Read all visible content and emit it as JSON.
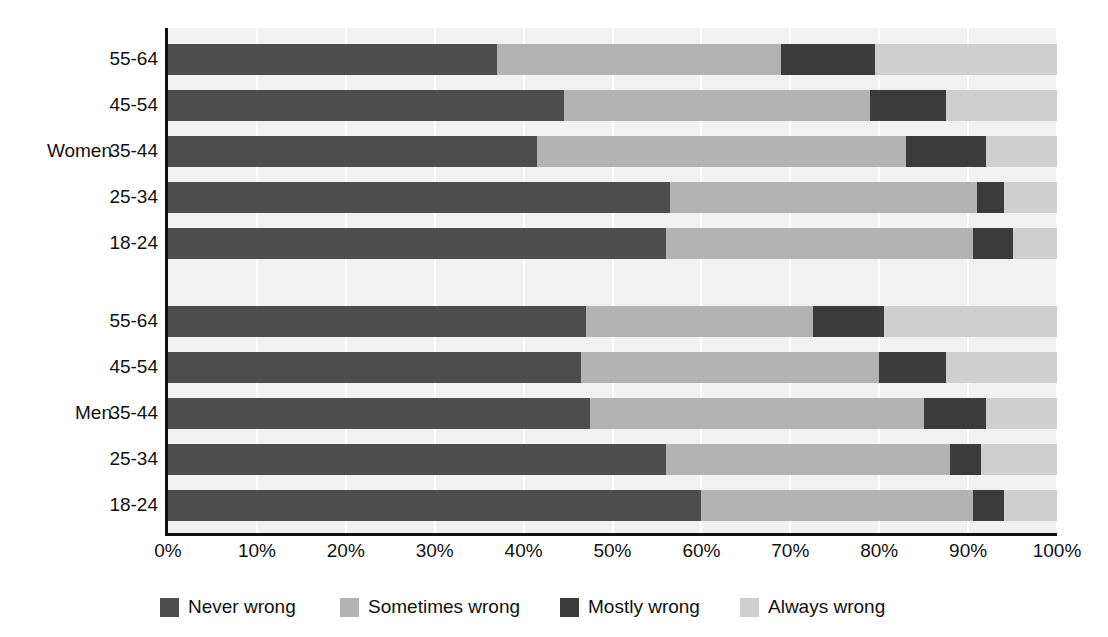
{
  "chart_data": {
    "type": "bar",
    "subtype": "stacked-horizontal-100",
    "title": "",
    "xlabel": "",
    "ylabel": "",
    "xlim": [
      0,
      100
    ],
    "xticks": [
      "0%",
      "10%",
      "20%",
      "30%",
      "40%",
      "50%",
      "60%",
      "70%",
      "80%",
      "90%",
      "100%"
    ],
    "xtick_values": [
      0,
      10,
      20,
      30,
      40,
      50,
      60,
      70,
      80,
      90,
      100
    ],
    "grid": true,
    "legend_position": "bottom",
    "groups": [
      "Women",
      "Men"
    ],
    "categories": [
      "55-64",
      "45-54",
      "35-44",
      "25-34",
      "18-24"
    ],
    "series": [
      {
        "name": "Never wrong",
        "color": "#4d4d4d"
      },
      {
        "name": "Sometimes wrong",
        "color": "#b3b3b3"
      },
      {
        "name": "Mostly wrong",
        "color": "#3b3b3b"
      },
      {
        "name": "Always wrong",
        "color": "#cfcfcf"
      }
    ],
    "rows": [
      {
        "group": "Women",
        "category": "55-64",
        "values": [
          37.0,
          32.0,
          10.5,
          20.5
        ]
      },
      {
        "group": "Women",
        "category": "45-54",
        "values": [
          44.5,
          34.5,
          8.5,
          12.5
        ]
      },
      {
        "group": "Women",
        "category": "35-44",
        "values": [
          41.5,
          41.5,
          9.0,
          8.0
        ]
      },
      {
        "group": "Women",
        "category": "25-34",
        "values": [
          56.5,
          34.5,
          3.0,
          6.0
        ]
      },
      {
        "group": "Women",
        "category": "18-24",
        "values": [
          56.0,
          34.5,
          4.5,
          5.0
        ]
      },
      {
        "group": "Men",
        "category": "55-64",
        "values": [
          47.0,
          25.5,
          8.0,
          19.5
        ]
      },
      {
        "group": "Men",
        "category": "45-54",
        "values": [
          46.5,
          33.5,
          7.5,
          12.5
        ]
      },
      {
        "group": "Men",
        "category": "35-44",
        "values": [
          47.5,
          37.5,
          7.0,
          8.0
        ]
      },
      {
        "group": "Men",
        "category": "25-34",
        "values": [
          56.0,
          32.0,
          3.5,
          8.5
        ]
      },
      {
        "group": "Men",
        "category": "18-24",
        "values": [
          60.0,
          30.5,
          3.5,
          6.0
        ]
      }
    ]
  },
  "legend": {
    "items": [
      {
        "label": "Never wrong",
        "color": "#4d4d4d"
      },
      {
        "label": "Sometimes wrong",
        "color": "#b3b3b3"
      },
      {
        "label": "Mostly wrong",
        "color": "#3b3b3b"
      },
      {
        "label": "Always wrong",
        "color": "#cfcfcf"
      }
    ]
  },
  "style": {
    "plot_background": "#f1f1f1",
    "gridline_color": "#ffffff",
    "axis_color": "#111111",
    "text_color": "#111111",
    "page_background": "#ffffff"
  }
}
